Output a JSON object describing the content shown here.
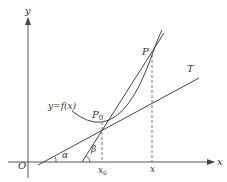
{
  "diagram": {
    "type": "derivative-geometric-interpretation",
    "colors": {
      "stroke": "#444444",
      "axis": "#555555",
      "text": "#333333",
      "dashed": "#555555"
    },
    "axes": {
      "x_label": "x",
      "y_label": "y",
      "origin_label": "O"
    },
    "curve": {
      "label": "y=f(x)"
    },
    "points": {
      "p0": {
        "name": "P",
        "sub": "0"
      },
      "p": {
        "name": "P"
      }
    },
    "ticks": {
      "x0": {
        "name": "x",
        "sub": "0"
      },
      "x": {
        "name": "x"
      }
    },
    "lines": {
      "tangent": {
        "label": "T"
      }
    },
    "angles": {
      "alpha": "α",
      "beta": "β"
    },
    "caption": ""
  }
}
